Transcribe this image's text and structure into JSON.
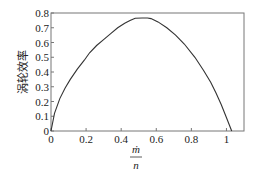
{
  "chart_data": {
    "type": "line",
    "title": "",
    "xlabel": "ṁ / n",
    "xlabel_numerator": "ṁ",
    "xlabel_denominator": "n",
    "ylabel": "涡轮效率",
    "xlim": [
      0,
      1.1
    ],
    "ylim": [
      0,
      0.8
    ],
    "grid": false,
    "legend": null,
    "x_ticks": [
      0,
      0.2,
      0.4,
      0.6,
      0.8,
      1
    ],
    "x_tick_labels": [
      "0",
      "0.2",
      "0.4",
      "0.6",
      "0.8",
      "1"
    ],
    "y_ticks": [
      0,
      0.1,
      0.2,
      0.3,
      0.4,
      0.5,
      0.6,
      0.7,
      0.8
    ],
    "y_tick_labels": [
      "0",
      "0.1",
      "0.2",
      "0.3",
      "0.4",
      "0.5",
      "0.6",
      "0.7",
      "0.8"
    ],
    "series": [
      {
        "name": "涡轮效率",
        "color": "#333333",
        "x": [
          0,
          0.02,
          0.05,
          0.08,
          0.11,
          0.15,
          0.19,
          0.22,
          0.26,
          0.3,
          0.34,
          0.38,
          0.42,
          0.45,
          0.48,
          0.52,
          0.55,
          0.57,
          0.61,
          0.66,
          0.71,
          0.76,
          0.82,
          0.87,
          0.91,
          0.94,
          0.97,
          1.0,
          1.03
        ],
        "y": [
          0,
          0.12,
          0.22,
          0.29,
          0.35,
          0.42,
          0.48,
          0.53,
          0.58,
          0.62,
          0.66,
          0.7,
          0.73,
          0.75,
          0.765,
          0.766,
          0.766,
          0.762,
          0.74,
          0.7,
          0.65,
          0.59,
          0.5,
          0.41,
          0.33,
          0.26,
          0.18,
          0.09,
          0
        ]
      }
    ]
  }
}
